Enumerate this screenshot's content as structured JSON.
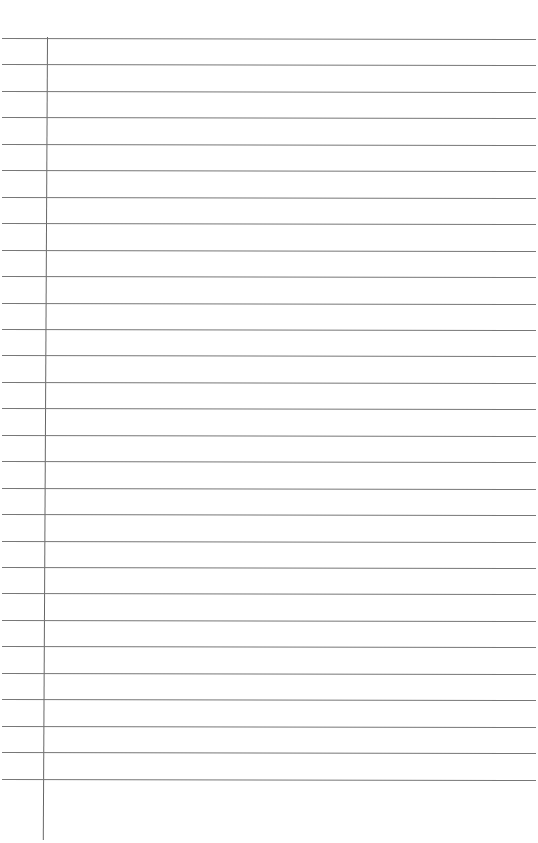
{
  "page": {
    "type": "lined-paper",
    "line_count": 29,
    "first_line_y": 38,
    "line_spacing": 26.45,
    "margin_x": 47,
    "line_color": "#777777",
    "margin_color": "#666666",
    "background": "#ffffff"
  }
}
